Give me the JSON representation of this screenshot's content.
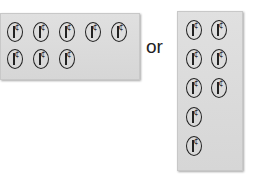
{
  "coin": {
    "value_label": "1¢",
    "cent_symbol": "¢",
    "shape": "oval outline with vertical bar and cent sign"
  },
  "arrangement_a": {
    "label": "5-by-2 array with 8 coins",
    "rows": [
      5,
      3
    ],
    "total_coins": 8
  },
  "connector": {
    "text": "or"
  },
  "arrangement_b": {
    "label": "2-column array with 8 coins",
    "rows": [
      2,
      2,
      2,
      1,
      1
    ],
    "total_coins": 8
  },
  "colors": {
    "tray": "#dcdcdc",
    "coin_outline": "#222222",
    "text": "#222222",
    "background": "#ffffff"
  }
}
